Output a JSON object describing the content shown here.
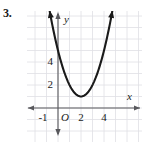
{
  "problem": {
    "number": "3."
  },
  "chart_data": {
    "type": "line",
    "title": "",
    "subtitle": "",
    "xlabel": "x",
    "ylabel": "y",
    "xlim": [
      -2.7,
      7.3
    ],
    "ylim": [
      -3.0,
      8.4
    ],
    "grid": true,
    "grid_spacing": 1,
    "legend": null,
    "origin_label": "O",
    "x_tick_labels": [
      "-1",
      "2",
      "4"
    ],
    "x_tick_values": [
      -1,
      2,
      4
    ],
    "y_tick_labels": [
      "2",
      "4"
    ],
    "y_tick_values": [
      2,
      4
    ],
    "axis_arrows": [
      "left",
      "right",
      "up",
      "down"
    ],
    "curve_arrows": [
      "up-left",
      "up-right"
    ],
    "curve_color": "#1a1a1a",
    "grid_color": "#e0e0e4",
    "axis_color": "#58585c",
    "background_color": "#ffffff",
    "series": [
      {
        "name": "parabola",
        "equation": "y = (x - 2)^2 + 1",
        "vertex": [
          2,
          1
        ],
        "x": [
          -0.45,
          0,
          0.5,
          1,
          1.5,
          2,
          2.5,
          3,
          3.5,
          4,
          4.5,
          4.8
        ],
        "values": [
          7.0,
          5.0,
          3.25,
          2.0,
          1.25,
          1.0,
          1.25,
          2.0,
          3.25,
          5.0,
          7.25,
          8.84
        ]
      }
    ]
  }
}
